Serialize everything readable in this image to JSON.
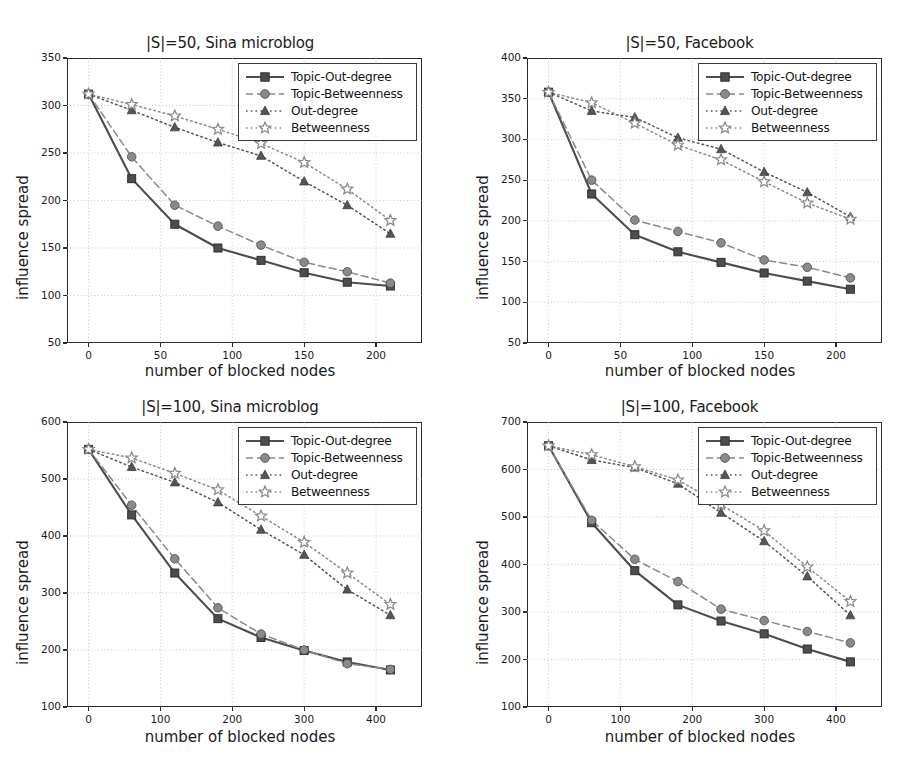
{
  "figure": {
    "width": 919,
    "height": 767,
    "background": "#ffffff"
  },
  "series_style": {
    "topic_out_degree": {
      "label": "Topic-Out-degree",
      "color": "#4d4d4d",
      "marker": "square",
      "line": "solid"
    },
    "topic_betweenness": {
      "label": "Topic-Betweenness",
      "color": "#8a8a8a",
      "marker": "circle",
      "line": "dashed"
    },
    "out_degree": {
      "label": "Out-degree",
      "color": "#555555",
      "marker": "triangle",
      "line": "dotted"
    },
    "betweenness": {
      "label": "Betweenness",
      "color": "#8a8a8a",
      "marker": "star",
      "line": "dotted"
    }
  },
  "legend": {
    "entries": [
      "Topic-Out-degree",
      "Topic-Betweenness",
      "Out-degree",
      "Betweenness"
    ]
  },
  "axis_labels": {
    "x": "number of blocked nodes",
    "y": "influence spread"
  },
  "chart_data": [
    {
      "id": "panel-1",
      "type": "line",
      "title": "|S|=50, Sina microblog",
      "xlabel": "number of blocked nodes",
      "ylabel": "influence spread",
      "x": [
        0,
        30,
        60,
        90,
        120,
        150,
        180,
        210
      ],
      "xlim": [
        -15,
        232
      ],
      "ylim": [
        50,
        350
      ],
      "xticks": [
        0,
        50,
        100,
        150,
        200
      ],
      "yticks": [
        50,
        100,
        150,
        200,
        250,
        300,
        350
      ],
      "grid": true,
      "legend_position": "upper right",
      "series": [
        {
          "name": "Topic-Out-degree",
          "values": [
            312,
            223,
            175,
            150,
            137,
            124,
            114,
            110
          ]
        },
        {
          "name": "Topic-Betweenness",
          "values": [
            312,
            246,
            195,
            173,
            153,
            135,
            125,
            113
          ]
        },
        {
          "name": "Out-degree",
          "values": [
            312,
            295,
            277,
            261,
            247,
            220,
            195,
            165
          ]
        },
        {
          "name": "Betweenness",
          "values": [
            312,
            301,
            289,
            275,
            260,
            240,
            212,
            179
          ]
        }
      ]
    },
    {
      "id": "panel-2",
      "type": "line",
      "title": "|S|=50, Facebook",
      "xlabel": "number of blocked nodes",
      "ylabel": "influence spread",
      "x": [
        0,
        30,
        60,
        90,
        120,
        150,
        180,
        210
      ],
      "xlim": [
        -15,
        232
      ],
      "ylim": [
        50,
        400
      ],
      "xticks": [
        0,
        50,
        100,
        150,
        200
      ],
      "yticks": [
        50,
        100,
        150,
        200,
        250,
        300,
        350,
        400
      ],
      "grid": true,
      "legend_position": "upper right",
      "series": [
        {
          "name": "Topic-Out-degree",
          "values": [
            358,
            233,
            183,
            162,
            149,
            136,
            126,
            116
          ]
        },
        {
          "name": "Topic-Betweenness",
          "values": [
            358,
            250,
            201,
            187,
            173,
            152,
            143,
            130
          ]
        },
        {
          "name": "Out-degree",
          "values": [
            358,
            335,
            327,
            302,
            288,
            260,
            235,
            205
          ]
        },
        {
          "name": "Betweenness",
          "values": [
            358,
            345,
            320,
            293,
            275,
            248,
            222,
            202
          ]
        }
      ]
    },
    {
      "id": "panel-3",
      "type": "line",
      "title": "|S|=100, Sina microblog",
      "xlabel": "number of blocked nodes",
      "ylabel": "influence spread",
      "x": [
        0,
        60,
        120,
        180,
        240,
        300,
        360,
        420
      ],
      "xlim": [
        -30,
        464
      ],
      "ylim": [
        100,
        600
      ],
      "xticks": [
        0,
        100,
        200,
        300,
        400
      ],
      "yticks": [
        100,
        200,
        300,
        400,
        500,
        600
      ],
      "grid": true,
      "legend_position": "upper right",
      "series": [
        {
          "name": "Topic-Out-degree",
          "values": [
            552,
            437,
            335,
            255,
            222,
            199,
            179,
            165
          ]
        },
        {
          "name": "Topic-Betweenness",
          "values": [
            552,
            454,
            360,
            274,
            228,
            200,
            176,
            166
          ]
        },
        {
          "name": "Out-degree",
          "values": [
            552,
            521,
            494,
            459,
            411,
            367,
            306,
            261
          ]
        },
        {
          "name": "Betweenness",
          "values": [
            552,
            537,
            510,
            481,
            435,
            389,
            335,
            280
          ]
        }
      ]
    },
    {
      "id": "panel-4",
      "type": "line",
      "title": "|S|=100, Facebook",
      "xlabel": "number of blocked nodes",
      "ylabel": "influence spread",
      "x": [
        0,
        60,
        120,
        180,
        240,
        300,
        360,
        420
      ],
      "xlim": [
        -30,
        464
      ],
      "ylim": [
        100,
        700
      ],
      "xticks": [
        0,
        100,
        200,
        300,
        400
      ],
      "yticks": [
        100,
        200,
        300,
        400,
        500,
        600,
        700
      ],
      "grid": true,
      "legend_position": "upper right",
      "series": [
        {
          "name": "Topic-Out-degree",
          "values": [
            650,
            488,
            387,
            315,
            281,
            254,
            222,
            195
          ]
        },
        {
          "name": "Topic-Betweenness",
          "values": [
            650,
            493,
            411,
            364,
            306,
            282,
            259,
            235
          ]
        },
        {
          "name": "Out-degree",
          "values": [
            650,
            620,
            604,
            570,
            509,
            449,
            375,
            293
          ]
        },
        {
          "name": "Betweenness",
          "values": [
            650,
            631,
            606,
            578,
            526,
            471,
            395,
            322
          ]
        }
      ]
    }
  ]
}
